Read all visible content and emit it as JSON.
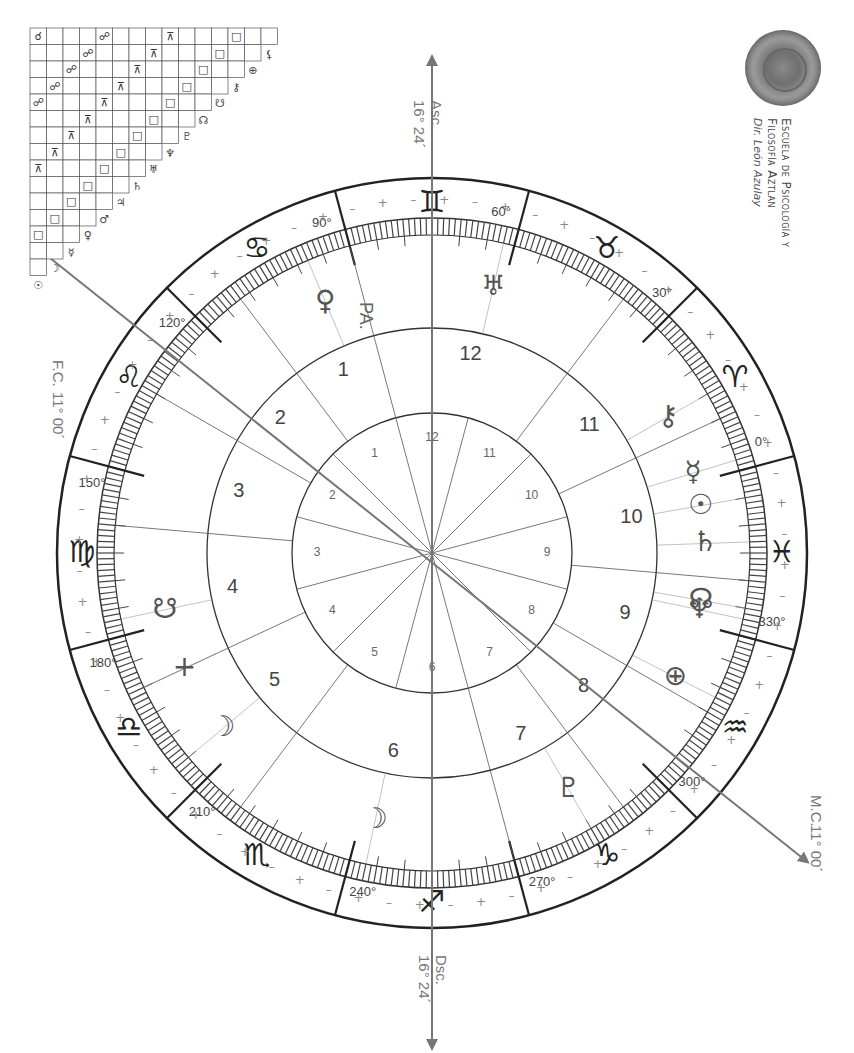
{
  "school": {
    "line1": "Escuela de Psicología y",
    "line2": "Filosofía Aztlan",
    "director": "Dir. León Azulay"
  },
  "angles": {
    "asc": {
      "label": "Asc.",
      "value": "16° 24´"
    },
    "dsc": {
      "label": "Dsc.",
      "value": "16° 24´"
    },
    "mc": {
      "label": "M.C.",
      "value": "11° 00´"
    },
    "fc": {
      "label": "F.C.",
      "value": "11° 00´"
    }
  },
  "chart": {
    "part_of_fortune_label": "PA.",
    "degree_markers": [
      "0°",
      "30°",
      "60°",
      "90°",
      "120°",
      "150°",
      "180°",
      "210°",
      "240°",
      "270°",
      "300°",
      "330°"
    ],
    "signs": [
      "♈",
      "♉",
      "♊",
      "♋",
      "♌",
      "♍",
      "♎",
      "♏",
      "♐",
      "♑",
      "♒",
      "♓"
    ],
    "houses_outer": [
      "1",
      "2",
      "3",
      "4",
      "5",
      "6",
      "7",
      "8",
      "9",
      "10",
      "11",
      "12"
    ],
    "houses_inner": [
      "1",
      "2",
      "3",
      "4",
      "5",
      "6",
      "7",
      "8",
      "9",
      "10",
      "11",
      "12"
    ],
    "planets": [
      {
        "name": "Sun",
        "glyph": "☉"
      },
      {
        "name": "Moon",
        "glyph": "☽"
      },
      {
        "name": "Mercury",
        "glyph": "☿"
      },
      {
        "name": "Venus",
        "glyph": "♀"
      },
      {
        "name": "Mars",
        "glyph": "♂"
      },
      {
        "name": "Jupiter",
        "glyph": "♃"
      },
      {
        "name": "Saturn",
        "glyph": "♄"
      },
      {
        "name": "Uranus",
        "glyph": "♅"
      },
      {
        "name": "Neptune",
        "glyph": "♆"
      },
      {
        "name": "Pluto",
        "glyph": "♇"
      },
      {
        "name": "North Node",
        "glyph": "☊"
      },
      {
        "name": "South Node",
        "glyph": "☋"
      },
      {
        "name": "Chiron",
        "glyph": "⚷"
      },
      {
        "name": "Earth",
        "glyph": "⊕"
      },
      {
        "name": "Lilith",
        "glyph": "⚸"
      },
      {
        "name": "Vertex",
        "glyph": "+"
      }
    ],
    "aspect_grid_symbols": [
      "☌",
      "⚹",
      "□",
      "△",
      "☍",
      "⚺",
      "⚻",
      "∠",
      "⊼",
      "Q"
    ]
  }
}
